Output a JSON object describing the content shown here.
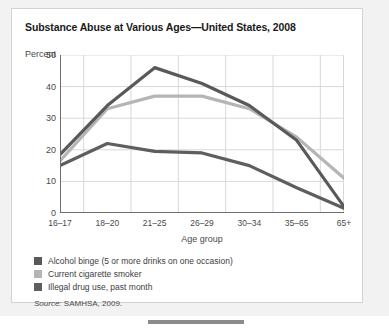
{
  "chart_data": {
    "type": "line",
    "title": "Substance Abuse at Various Ages—United States, 2008",
    "xlabel": "Age group",
    "ylabel": "Percent",
    "categories": [
      "16–17",
      "18–20",
      "21–25",
      "26–29",
      "30–34",
      "35–65",
      "65+"
    ],
    "yticks": [
      0,
      10,
      20,
      30,
      40,
      50
    ],
    "ylim": [
      0,
      50
    ],
    "grid": "both",
    "legend_position": "below-plot-left",
    "series": [
      {
        "name": "Alcohol binge (5 or more drinks on one occasion)",
        "color": "#595959",
        "values": [
          18.5,
          34,
          46,
          41,
          34,
          23,
          2
        ]
      },
      {
        "name": "Current cigarette smoker",
        "color": "#b5b5b5",
        "values": [
          16.5,
          33,
          37,
          37,
          33,
          24,
          11
        ]
      },
      {
        "name": "Illegal drug use, past month",
        "color": "#5e5e5e",
        "values": [
          15,
          22,
          19.5,
          19,
          15,
          8,
          1.5
        ]
      }
    ],
    "source": "Source: SAMHSA, 2009.",
    "source_prefix": "Source:",
    "source_rest": " SAMHSA, 2009."
  },
  "scrollbar": {
    "name": "horizontal-scrollbar"
  }
}
